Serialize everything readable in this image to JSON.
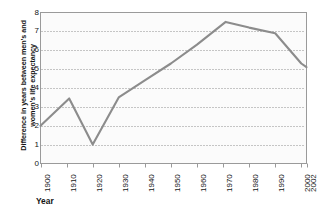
{
  "chart_data": {
    "type": "line",
    "title": "",
    "xlabel": "Year",
    "ylabel": "Difference in years between men's and women's life expectancy",
    "xlim": [
      1900,
      2002
    ],
    "ylim": [
      0,
      8
    ],
    "ytick_labels": [
      "8",
      "7",
      "6",
      "5",
      "4",
      "3",
      "2",
      "1",
      "0"
    ],
    "ytick_values": [
      8,
      7,
      6,
      5,
      4,
      3,
      2,
      1,
      0
    ],
    "xtick_labels": [
      "1900",
      "1910",
      "1920",
      "1930",
      "1940",
      "1950",
      "1960",
      "1970",
      "1980",
      "1990",
      "2000",
      "2002"
    ],
    "xtick_values": [
      1900,
      1910,
      1920,
      1930,
      1940,
      1950,
      1960,
      1970,
      1980,
      1990,
      2000,
      2002
    ],
    "grid": "horizontal-dotted",
    "legend": "none",
    "x": [
      1900,
      1911,
      1920,
      1930,
      1940,
      1950,
      1960,
      1971,
      1980,
      1990,
      2000,
      2002
    ],
    "values": [
      2.0,
      3.45,
      1.0,
      3.5,
      4.4,
      5.3,
      6.3,
      7.5,
      7.2,
      6.9,
      5.3,
      5.1
    ],
    "series": [
      {
        "name": "Difference in life expectancy",
        "color": "#8c8c8c",
        "values": [
          2.0,
          3.45,
          1.0,
          3.5,
          4.4,
          5.3,
          6.3,
          7.5,
          7.2,
          6.9,
          5.3,
          5.1
        ]
      }
    ]
  },
  "style": {
    "line_color": "#8c8c8c",
    "grid_color": "#8e8e8e",
    "axis_color": "#9a9a9a",
    "plot_background": "#fbfbfb",
    "text_color": "#141414"
  }
}
